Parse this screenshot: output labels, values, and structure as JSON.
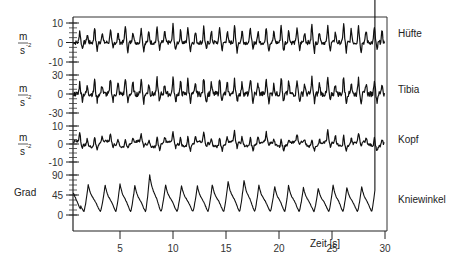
{
  "chart_data": {
    "type": "line",
    "title": "",
    "xlabel": "Zeit [s]",
    "xlim": [
      0.5,
      30
    ],
    "x_ticks": [
      5,
      10,
      15,
      20,
      25,
      30
    ],
    "grid": false,
    "legend_position": "right (series labels at right of each trace)",
    "series": [
      {
        "name": "Hüfte",
        "unit_label": [
          "m",
          "s²"
        ],
        "y_ticks": [
          10,
          0,
          -10
        ],
        "ylim": [
          -10,
          10
        ],
        "description": "Hip acceleration, periodic spikes ~1.45 s cycle with double peaks, amplitude up to ~10 m/s², negative dips to ~-8",
        "peak_times": [
          1.2,
          2.6,
          4.1,
          5.5,
          7.0,
          8.5,
          10.0,
          11.4,
          12.9,
          14.4,
          15.8,
          17.3,
          18.8,
          20.2,
          21.7,
          23.1,
          24.6,
          26.1,
          27.5,
          29.0
        ],
        "peak_values": [
          6,
          8,
          7,
          9,
          8,
          8,
          9,
          8,
          8,
          8,
          9,
          8,
          8,
          9,
          8,
          9,
          8,
          10,
          9,
          8
        ]
      },
      {
        "name": "Tibia",
        "unit_label": [
          "m",
          "s²"
        ],
        "y_ticks": [
          30,
          0,
          -30
        ],
        "ylim": [
          -30,
          30
        ],
        "description": "Tibia acceleration, noisy baseline near 0 with sharp spikes to ~25 m/s² and dips to ~-20 m/s²",
        "peak_times": [
          1.2,
          2.6,
          4.1,
          5.5,
          7.0,
          8.5,
          10.0,
          11.4,
          12.9,
          14.4,
          15.8,
          17.3,
          18.8,
          20.2,
          21.7,
          23.1,
          24.6,
          26.1,
          27.5,
          29.0
        ],
        "peak_values": [
          18,
          22,
          24,
          26,
          25,
          24,
          26,
          22,
          25,
          24,
          26,
          25,
          23,
          27,
          24,
          26,
          25,
          28,
          26,
          24
        ]
      },
      {
        "name": "Kopf",
        "unit_label": [
          "m",
          "s²"
        ],
        "y_ticks": [
          10,
          0,
          -10
        ],
        "ylim": [
          -10,
          10
        ],
        "description": "Head acceleration, smaller oscillations ~±5 m/s², roughly two bumps per cycle",
        "peak_times": [
          1.2,
          2.6,
          4.1,
          5.5,
          7.0,
          8.5,
          10.0,
          11.4,
          12.9,
          14.4,
          15.8,
          17.3,
          18.8,
          20.2,
          21.7,
          23.1,
          24.6,
          26.1,
          27.5,
          29.0
        ],
        "peak_values": [
          6,
          5,
          5,
          4,
          4,
          5,
          6,
          5,
          5,
          5,
          6,
          5,
          5,
          4,
          4,
          4,
          7,
          6,
          5,
          5
        ]
      },
      {
        "name": "Kniewinkel",
        "unit_label": [
          "Grad"
        ],
        "y_ticks": [
          90,
          45,
          0
        ],
        "ylim": [
          0,
          100
        ],
        "description": "Knee angle in degrees, sawtooth-like gait cycles: fast rise to peak then slower decline to ~5-10 degrees",
        "peak_times": [
          2.0,
          3.6,
          5.0,
          6.4,
          7.8,
          9.3,
          10.8,
          12.3,
          13.7,
          15.2,
          16.7,
          18.1,
          19.6,
          20.9,
          22.3,
          23.7,
          25.1,
          26.4,
          27.8,
          29.1
        ],
        "peak_values": [
          68,
          67,
          70,
          66,
          90,
          68,
          66,
          66,
          68,
          75,
          78,
          67,
          64,
          66,
          62,
          60,
          67,
          62,
          64,
          66
        ],
        "trough_values": [
          8,
          8,
          7,
          9,
          8,
          8,
          8,
          8,
          8,
          8,
          7,
          8,
          8,
          9,
          9,
          9,
          8,
          8,
          8,
          8
        ]
      }
    ]
  },
  "labels": {
    "series_names": [
      "Hüfte",
      "Tibia",
      "Kopf",
      "Kniewinkel"
    ],
    "unit_m": "m",
    "unit_s2": "s",
    "unit_s2_exp": "-2",
    "unit_grad": "Grad",
    "xlabel": "Zeit [s]"
  }
}
